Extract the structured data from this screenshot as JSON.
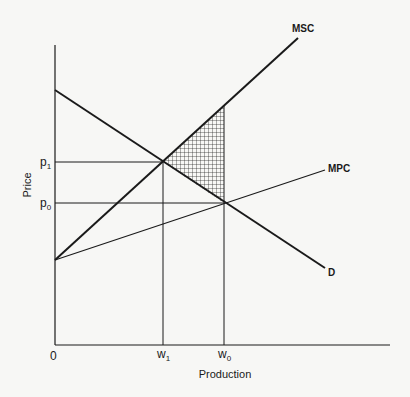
{
  "diagram": {
    "type": "economics-supply-demand",
    "x_axis": {
      "label": "Production",
      "origin_label": "0"
    },
    "y_axis": {
      "label": "Price"
    },
    "x_ticks": [
      {
        "base": "w",
        "sub": "1",
        "key": "w1"
      },
      {
        "base": "w",
        "sub": "0",
        "key": "w0"
      }
    ],
    "y_ticks": [
      {
        "base": "p",
        "sub": "1",
        "key": "p1"
      },
      {
        "base": "p",
        "sub": "0",
        "key": "p0"
      }
    ],
    "curves": [
      {
        "name": "MSC",
        "label": "MSC",
        "description": "Marginal social cost (upward sloping, steep)"
      },
      {
        "name": "MPC",
        "label": "MPC",
        "description": "Marginal private cost (upward sloping, shallow)"
      },
      {
        "name": "D",
        "label": "D",
        "description": "Demand (downward sloping)"
      }
    ],
    "shaded_region": {
      "description": "Deadweight loss triangle between MSC and D from w1 to w0",
      "pattern": "crosshatch"
    },
    "colors": {
      "ink": "#1a1a1a",
      "paper": "#f7f7f5"
    }
  }
}
